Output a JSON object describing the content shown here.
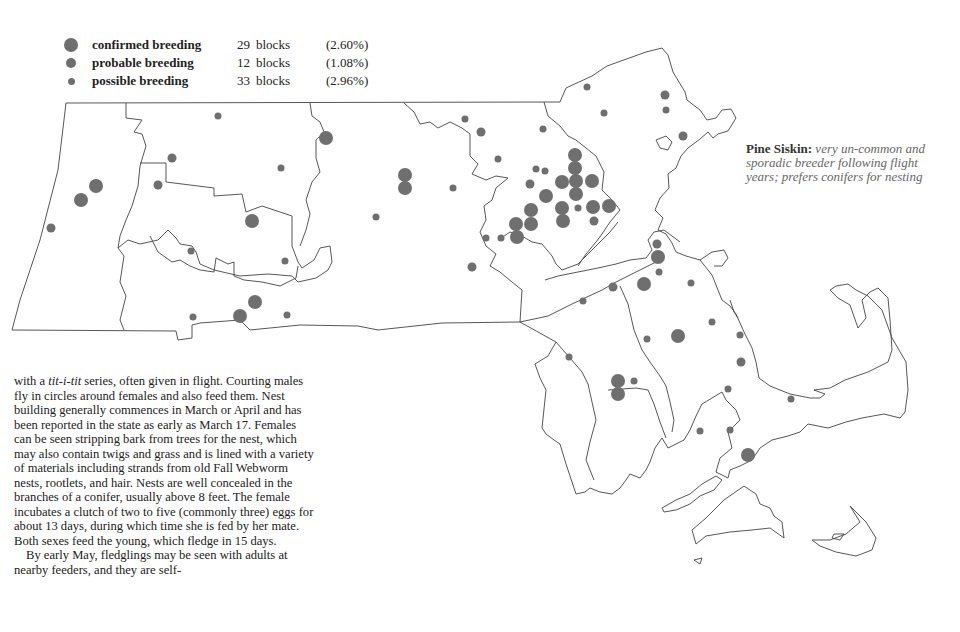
{
  "legend": {
    "items": [
      {
        "label": "confirmed breeding",
        "count": "29",
        "unit": "blocks",
        "percent": "(2.60%)",
        "dot_size": 14
      },
      {
        "label": "probable breeding",
        "count": "12",
        "unit": "blocks",
        "percent": "(1.08%)",
        "dot_size": 10
      },
      {
        "label": "possible breeding",
        "count": "33",
        "unit": "blocks",
        "percent": "(2.96%)",
        "dot_size": 7
      }
    ]
  },
  "caption": {
    "species": "Pine Siskin:",
    "description": "very un-common and sporadic breeder following flight years; prefers conifers for nesting"
  },
  "body_text": {
    "paragraph1_start": "with a ",
    "paragraph1_italic": "tit-i-tit",
    "paragraph1_rest": " series, often given in flight. Courting males fly in circles around females and also feed them. Nest building generally commences in March or April and has been reported in the state as early as March 17. Females can be seen stripping bark from trees for the nest, which may also contain twigs and grass and is lined with a variety of materials including strands from old Fall Webworm nests, rootlets, and hair. Nests are well concealed in the branches of a conifer, usually above 8 feet. The female incubates a clutch of two to five (commonly three) eggs for about 13 days, during which time she is fed by her mate. Both sexes feed the young, which fledge in 15 days.",
    "paragraph2": "By early May, fledglings may be seen with adults at nearby feeders, and they are self-"
  },
  "colors": {
    "dot": "#6f6f6f",
    "outline": "#444444",
    "caption_text": "#666666"
  },
  "map": {
    "dots": [
      {
        "x": 72,
        "y": 45,
        "r": 7
      },
      {
        "x": 96,
        "y": 186,
        "r": 7
      },
      {
        "x": 81,
        "y": 200,
        "r": 7
      },
      {
        "x": 51,
        "y": 228,
        "r": 4.5
      },
      {
        "x": 218,
        "y": 116,
        "r": 3.5
      },
      {
        "x": 172,
        "y": 158,
        "r": 4.5
      },
      {
        "x": 158,
        "y": 185,
        "r": 4.5
      },
      {
        "x": 281,
        "y": 168,
        "r": 3.5
      },
      {
        "x": 326,
        "y": 138,
        "r": 7
      },
      {
        "x": 252,
        "y": 221,
        "r": 7
      },
      {
        "x": 191,
        "y": 251,
        "r": 3.5
      },
      {
        "x": 285,
        "y": 261,
        "r": 3.5
      },
      {
        "x": 255,
        "y": 302,
        "r": 7
      },
      {
        "x": 240,
        "y": 316,
        "r": 7
      },
      {
        "x": 193,
        "y": 317,
        "r": 3.5
      },
      {
        "x": 287,
        "y": 315,
        "r": 3.5
      },
      {
        "x": 405,
        "y": 175,
        "r": 7
      },
      {
        "x": 405,
        "y": 188,
        "r": 7
      },
      {
        "x": 376,
        "y": 217,
        "r": 3.5
      },
      {
        "x": 453,
        "y": 188,
        "r": 3.5
      },
      {
        "x": 465,
        "y": 119,
        "r": 3.5
      },
      {
        "x": 481,
        "y": 132,
        "r": 4.5
      },
      {
        "x": 543,
        "y": 129,
        "r": 3.5
      },
      {
        "x": 498,
        "y": 159,
        "r": 3.5
      },
      {
        "x": 536,
        "y": 169,
        "r": 3.5
      },
      {
        "x": 545,
        "y": 171,
        "r": 3.5
      },
      {
        "x": 530,
        "y": 184,
        "r": 4.5
      },
      {
        "x": 546,
        "y": 196,
        "r": 7
      },
      {
        "x": 531,
        "y": 210,
        "r": 7
      },
      {
        "x": 531,
        "y": 224,
        "r": 7
      },
      {
        "x": 516,
        "y": 224,
        "r": 7
      },
      {
        "x": 517,
        "y": 237,
        "r": 7
      },
      {
        "x": 486,
        "y": 238,
        "r": 3.5
      },
      {
        "x": 501,
        "y": 238,
        "r": 3.5
      },
      {
        "x": 472,
        "y": 267,
        "r": 4.5
      },
      {
        "x": 575,
        "y": 155,
        "r": 7
      },
      {
        "x": 575,
        "y": 168,
        "r": 7
      },
      {
        "x": 576,
        "y": 181,
        "r": 7
      },
      {
        "x": 592,
        "y": 181,
        "r": 7
      },
      {
        "x": 576,
        "y": 194,
        "r": 7
      },
      {
        "x": 562,
        "y": 182,
        "r": 7
      },
      {
        "x": 562,
        "y": 208,
        "r": 7
      },
      {
        "x": 563,
        "y": 221,
        "r": 7
      },
      {
        "x": 578,
        "y": 208,
        "r": 3.5
      },
      {
        "x": 593,
        "y": 207,
        "r": 7
      },
      {
        "x": 609,
        "y": 206,
        "r": 7
      },
      {
        "x": 594,
        "y": 221,
        "r": 4.5
      },
      {
        "x": 587,
        "y": 87,
        "r": 3.5
      },
      {
        "x": 604,
        "y": 113,
        "r": 3.5
      },
      {
        "x": 665,
        "y": 95,
        "r": 4.5
      },
      {
        "x": 666,
        "y": 110,
        "r": 3.5
      },
      {
        "x": 683,
        "y": 136,
        "r": 4.5
      },
      {
        "x": 657,
        "y": 244,
        "r": 4.5
      },
      {
        "x": 658,
        "y": 257,
        "r": 7
      },
      {
        "x": 659,
        "y": 272,
        "r": 3.5
      },
      {
        "x": 644,
        "y": 284,
        "r": 7
      },
      {
        "x": 613,
        "y": 287,
        "r": 4.5
      },
      {
        "x": 691,
        "y": 283,
        "r": 3.5
      },
      {
        "x": 583,
        "y": 301,
        "r": 3.5
      },
      {
        "x": 678,
        "y": 336,
        "r": 7
      },
      {
        "x": 647,
        "y": 339,
        "r": 3.5
      },
      {
        "x": 569,
        "y": 357,
        "r": 3.5
      },
      {
        "x": 740,
        "y": 335,
        "r": 3.5
      },
      {
        "x": 712,
        "y": 322,
        "r": 3.5
      },
      {
        "x": 741,
        "y": 362,
        "r": 4.5
      },
      {
        "x": 618,
        "y": 381,
        "r": 7
      },
      {
        "x": 618,
        "y": 394,
        "r": 7
      },
      {
        "x": 634,
        "y": 381,
        "r": 3.5
      },
      {
        "x": 728,
        "y": 389,
        "r": 3.5
      },
      {
        "x": 791,
        "y": 399,
        "r": 3.5
      },
      {
        "x": 700,
        "y": 431,
        "r": 3.5
      },
      {
        "x": 730,
        "y": 430,
        "r": 3.5
      },
      {
        "x": 748,
        "y": 455,
        "r": 7
      }
    ]
  }
}
